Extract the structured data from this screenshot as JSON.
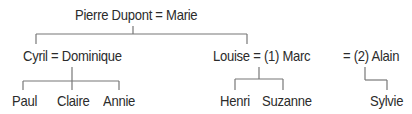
{
  "diagram": {
    "type": "family-tree",
    "generation_1": {
      "couple_label": "Pierre Dupont = Marie",
      "members": [
        "Pierre Dupont",
        "Marie"
      ]
    },
    "generation_2": [
      {
        "couple_label": "Cyril = Dominique",
        "members": [
          "Cyril",
          "Dominique"
        ],
        "children": [
          "Paul",
          "Claire",
          "Annie"
        ]
      },
      {
        "couple_label": "Louise = (1) Marc",
        "members": [
          "Louise",
          "Marc"
        ],
        "marriage_number": "(1)",
        "children": [
          "Henri",
          "Suzanne"
        ]
      },
      {
        "couple_label": "= (2) Alain",
        "members": [
          "Louise",
          "Alain"
        ],
        "marriage_number": "(2)",
        "children": [
          "Sylvie"
        ]
      }
    ],
    "line_color": "#777777",
    "text_color": "#2b2b2b"
  }
}
